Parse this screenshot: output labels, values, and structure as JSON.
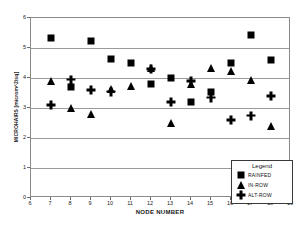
{
  "chart_data": {
    "type": "scatter",
    "title": "",
    "xlabel": "NODE NUMBER",
    "ylabel": "MICROHAIRS [microm^2/sq]",
    "xlim": [
      6,
      19
    ],
    "ylim": [
      0,
      6
    ],
    "xticks": [
      6,
      7,
      8,
      9,
      10,
      11,
      12,
      13,
      14,
      15,
      16,
      17,
      18,
      19
    ],
    "yticks": [
      0,
      1,
      2,
      3,
      4,
      5,
      6
    ],
    "grid": "horizontal",
    "legend_position": "bottom-right",
    "legend_title": "Legend",
    "x": [
      7,
      8,
      9,
      10,
      11,
      12,
      13,
      14,
      15,
      16,
      17,
      18
    ],
    "series": [
      {
        "name": "RAINFED",
        "marker": "square",
        "x": [
          7,
          8,
          9,
          10,
          11,
          12,
          13,
          14,
          15,
          16,
          17,
          18
        ],
        "values": [
          5.35,
          3.7,
          5.25,
          4.65,
          4.5,
          3.8,
          4.0,
          3.2,
          3.55,
          4.5,
          5.45,
          4.6
        ]
      },
      {
        "name": "IN-ROW",
        "marker": "triangle",
        "x": [
          7,
          8,
          9,
          10,
          11,
          12,
          13,
          14,
          15,
          16,
          17,
          18
        ],
        "values": [
          3.9,
          3.0,
          2.8,
          3.65,
          3.75,
          4.35,
          2.5,
          3.8,
          4.35,
          4.25,
          3.95,
          2.4
        ]
      },
      {
        "name": "ALT-ROW",
        "marker": "plus",
        "x": [
          7,
          8,
          9,
          10,
          12,
          13,
          14,
          15,
          16,
          17,
          18
        ],
        "values": [
          3.1,
          3.95,
          3.6,
          3.55,
          4.3,
          3.2,
          3.9,
          3.35,
          2.6,
          2.75,
          3.4
        ]
      }
    ]
  }
}
